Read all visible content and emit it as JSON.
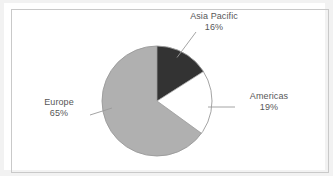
{
  "chart_data": {
    "type": "pie",
    "title": "",
    "categories": [
      "Asia Pacific",
      "Americas",
      "Europe"
    ],
    "values": [
      16,
      19,
      65
    ],
    "value_unit": "%",
    "start_angle_deg": 0,
    "direction": "clockwise",
    "legend": "none",
    "grid": false,
    "slices": [
      {
        "label": "Asia Pacific",
        "value": 16,
        "value_text": "16%",
        "color": "#333333"
      },
      {
        "label": "Americas",
        "value": 19,
        "value_text": "19%",
        "color": "#ffffff"
      },
      {
        "label": "Europe",
        "value": 65,
        "value_text": "65%",
        "color": "#b0b0b0"
      }
    ]
  },
  "labels": {
    "asia": {
      "name": "Asia Pacific",
      "pct": "16%"
    },
    "americas": {
      "name": "Americas",
      "pct": "19%"
    },
    "europe": {
      "name": "Europe",
      "pct": "65%"
    }
  },
  "colors": {
    "asia_pacific": "#333333",
    "americas": "#ffffff",
    "europe": "#b0b0b0",
    "slice_outline": "#9a9a9a",
    "leader_line": "#9a9a9a",
    "label_text": "#575757",
    "frame_border": "#c9c9c9",
    "page_background": "#f2f2f2",
    "card_background": "#ffffff"
  }
}
